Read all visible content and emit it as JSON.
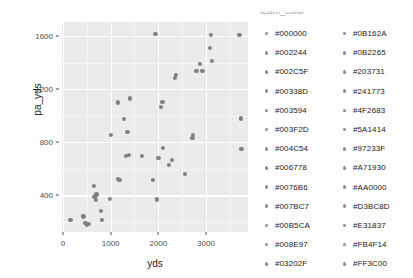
{
  "chart_data": {
    "type": "scatter",
    "title": "",
    "xlabel": "yds",
    "ylabel": "pa_yds",
    "xlim": [
      -20,
      3880
    ],
    "ylim": [
      125,
      1705
    ],
    "xticks": [
      0,
      1000,
      2000,
      3000
    ],
    "yticks": [
      400,
      800,
      1200,
      1600
    ],
    "xtick_labels": [
      "0",
      "1000",
      "2000",
      "3000"
    ],
    "ytick_labels": [
      "400",
      "800",
      "1200",
      "1600"
    ],
    "grid": true,
    "grid_major_color": "#ffffff",
    "grid_minor_color": "#f5f5f5",
    "panel_background": "#ebebeb",
    "point_color": "#808080",
    "legend_position": "right",
    "legend_title": "team_color",
    "points": [
      {
        "x": 155,
        "y": 215
      },
      {
        "x": 430,
        "y": 243
      },
      {
        "x": 470,
        "y": 196
      },
      {
        "x": 500,
        "y": 178
      },
      {
        "x": 545,
        "y": 185
      },
      {
        "x": 650,
        "y": 470
      },
      {
        "x": 660,
        "y": 392
      },
      {
        "x": 680,
        "y": 398
      },
      {
        "x": 690,
        "y": 366
      },
      {
        "x": 700,
        "y": 413
      },
      {
        "x": 715,
        "y": 405
      },
      {
        "x": 790,
        "y": 283
      },
      {
        "x": 815,
        "y": 214
      },
      {
        "x": 980,
        "y": 372
      },
      {
        "x": 1000,
        "y": 855
      },
      {
        "x": 1155,
        "y": 525
      },
      {
        "x": 1185,
        "y": 515
      },
      {
        "x": 1160,
        "y": 1100
      },
      {
        "x": 1275,
        "y": 975
      },
      {
        "x": 1325,
        "y": 700
      },
      {
        "x": 1350,
        "y": 877
      },
      {
        "x": 1380,
        "y": 705
      },
      {
        "x": 1400,
        "y": 1130
      },
      {
        "x": 1660,
        "y": 700
      },
      {
        "x": 1890,
        "y": 520
      },
      {
        "x": 1940,
        "y": 1615
      },
      {
        "x": 1975,
        "y": 370
      },
      {
        "x": 2000,
        "y": 680
      },
      {
        "x": 2055,
        "y": 1065
      },
      {
        "x": 2085,
        "y": 1105
      },
      {
        "x": 2100,
        "y": 755
      },
      {
        "x": 2220,
        "y": 630
      },
      {
        "x": 2285,
        "y": 670
      },
      {
        "x": 2340,
        "y": 1285
      },
      {
        "x": 2375,
        "y": 1310
      },
      {
        "x": 2560,
        "y": 565
      },
      {
        "x": 2715,
        "y": 830
      },
      {
        "x": 2725,
        "y": 855
      },
      {
        "x": 2800,
        "y": 1340
      },
      {
        "x": 2880,
        "y": 1390
      },
      {
        "x": 2925,
        "y": 1335
      },
      {
        "x": 3075,
        "y": 1510
      },
      {
        "x": 3110,
        "y": 1605
      },
      {
        "x": 3130,
        "y": 1415
      },
      {
        "x": 3700,
        "y": 1610
      },
      {
        "x": 3730,
        "y": 980
      },
      {
        "x": 3740,
        "y": 750
      }
    ],
    "legend_entries": [
      "#000000",
      "#002244",
      "#002C5F",
      "#00338D",
      "#003594",
      "#003F2D",
      "#004C54",
      "#006778",
      "#0076B6",
      "#007BC7",
      "#00B5CA",
      "#008E97",
      "#03202F",
      "#0B162A",
      "#0B2265",
      "#203731",
      "#241773",
      "#4F2683",
      "#5A1414",
      "#97233F",
      "#A71930",
      "#AA0000",
      "#D3BC8D",
      "#E31837",
      "#FB4F14",
      "#FF3C00"
    ],
    "legend_col1": [
      "#000000",
      "#002244",
      "#002C5F",
      "#00338D",
      "#003594",
      "#003F2D",
      "#004C54",
      "#006778",
      "#0076B6",
      "#007BC7",
      "#00B5CA",
      "#008E97",
      "#03202F"
    ],
    "legend_col2": [
      "#0B162A",
      "#0B2265",
      "#203731",
      "#241773",
      "#4F2683",
      "#5A1414",
      "#97233F",
      "#A71930",
      "#AA0000",
      "#D3BC8D",
      "#E31837",
      "#FB4F14",
      "#FF3C00"
    ]
  },
  "axes": {
    "x_title": "yds",
    "y_title": "pa_yds"
  },
  "legend": {
    "title": "team_color"
  }
}
